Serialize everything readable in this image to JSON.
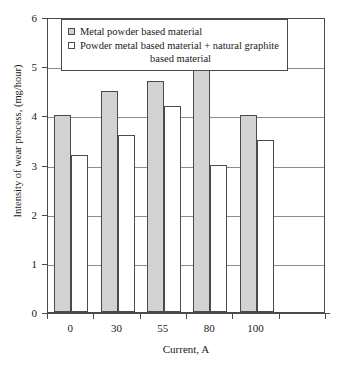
{
  "chart_data": {
    "type": "bar",
    "title": "",
    "xlabel": "Current, A",
    "ylabel": "Intensity of wear process, (mg/hour)",
    "categories": [
      "0",
      "30",
      "55",
      "80",
      "100"
    ],
    "ylim": [
      0,
      6
    ],
    "yticks": [
      "0",
      "1",
      "2",
      "3",
      "4",
      "5",
      "6"
    ],
    "grid": "horizontal",
    "legend_position": "top-center-inside",
    "series": [
      {
        "name": "Metal powder based material",
        "color": "#d2d2d2",
        "values": [
          4.0,
          4.5,
          4.7,
          5.0,
          4.0
        ]
      },
      {
        "name": "Powder metal based material + natural graphite based material",
        "color": "#ffffff",
        "values": [
          3.2,
          3.6,
          4.2,
          3.0,
          3.5
        ]
      }
    ]
  },
  "legend": {
    "entries": [
      {
        "label": "Metal powder based material",
        "line1": "Metal powder based material",
        "line2": ""
      },
      {
        "label": "Powder metal based material + natural graphite based material",
        "line1": "Powder metal based material + natural graphite",
        "line2": "based material"
      }
    ]
  },
  "axes": {
    "y_title": "Intensity of wear process, (mg/hour)",
    "x_title": "Current, A"
  },
  "colors": {
    "series_a_fill": "#d2d2d2",
    "series_b_fill": "#ffffff",
    "axis_line": "#4a4a4a",
    "gridline": "#8c8c8c",
    "background": "#ffffff"
  }
}
